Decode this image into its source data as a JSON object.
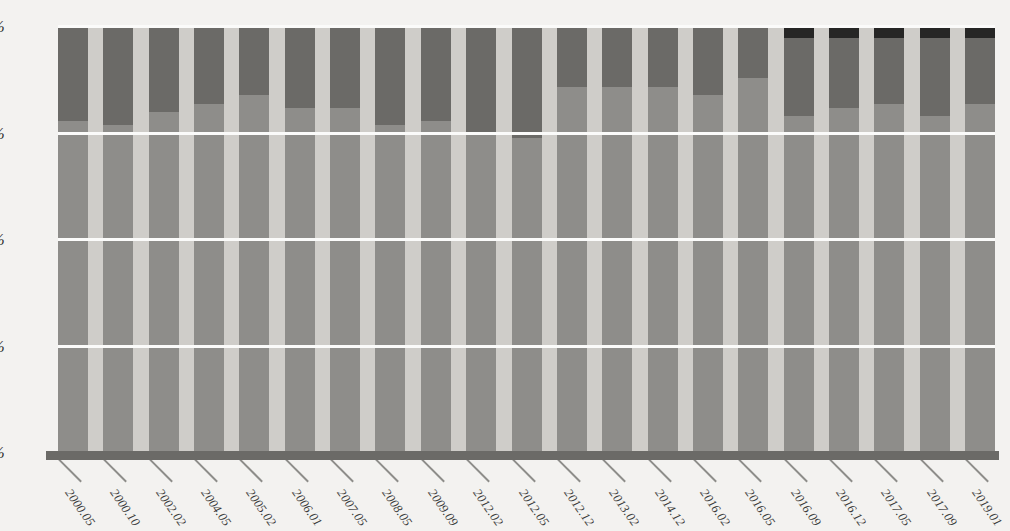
{
  "chart_data": {
    "type": "bar",
    "subtype": "stacked-percentage",
    "title": "",
    "xlabel": "",
    "ylabel": "",
    "ylim": [
      0,
      100
    ],
    "yticks": [
      "0%",
      "25%",
      "50%",
      "75%",
      "100%"
    ],
    "ytick_values": [
      0,
      25,
      50,
      75,
      100
    ],
    "grid": true,
    "grid_orientation": "horizontal",
    "legend": "none",
    "stacked_total": 100,
    "categories": [
      "2000.05",
      "2000.10",
      "2002.02",
      "2004.05",
      "2005.02",
      "2006.01",
      "2007.05",
      "2008.05",
      "2009.09",
      "2012.02",
      "2012.05",
      "2012.12",
      "2013.02",
      "2014.12",
      "2016.02",
      "2016.05",
      "2016.09",
      "2016.12",
      "2017.05",
      "2017.09",
      "2019.01"
    ],
    "series": [
      {
        "name": "series-1",
        "color": "#8e8d8a",
        "values": [
          78,
          77,
          80,
          82,
          84,
          81,
          81,
          77,
          78,
          75,
          74,
          86,
          86,
          86,
          84,
          88,
          79,
          81,
          82,
          79,
          82
        ]
      },
      {
        "name": "series-2",
        "color": "#6b6a67",
        "values": [
          22,
          23,
          20,
          18,
          16,
          19,
          19,
          23,
          22,
          25,
          26,
          14,
          14,
          14,
          16,
          12,
          18.5,
          16.5,
          15.5,
          18.5,
          15.5
        ]
      },
      {
        "name": "series-3",
        "color": "#262625",
        "values": [
          0,
          0,
          0,
          0,
          0,
          0,
          0,
          0,
          0,
          0,
          0,
          0,
          0,
          0,
          0,
          0,
          2.5,
          2.5,
          2.5,
          2.5,
          2.5
        ]
      }
    ]
  },
  "colors": {
    "plot_background": "#cfcdc9",
    "page_background": "#f3f2f0",
    "gridline": "#fbfbfa",
    "axis_line": "#6b6a67",
    "series_1": "#8e8d8a",
    "series_2": "#6b6a67",
    "series_3": "#262625",
    "tick_label": "#2e2e2e"
  }
}
